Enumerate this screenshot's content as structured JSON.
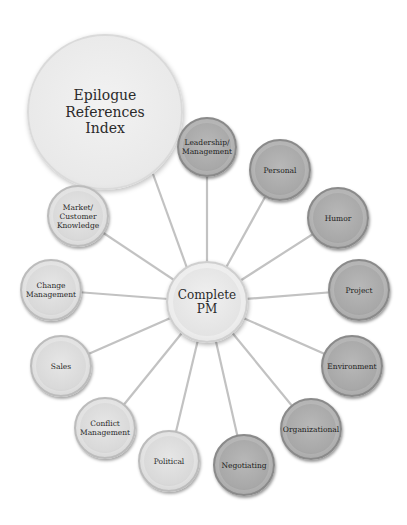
{
  "diagram": {
    "type": "hub-and-spoke",
    "center": {
      "label": "Complete\nPM",
      "x": 207,
      "y": 302,
      "r": 41
    },
    "corner_node": {
      "label": "Epilogue\nReferences\nIndex",
      "x": 105,
      "y": 112,
      "r": 78
    },
    "spokes": [
      {
        "id": "leadership",
        "label": "Leadership/\nManagement",
        "x": 207,
        "y": 147,
        "r": 30,
        "shade": "dark"
      },
      {
        "id": "personal",
        "label": "Personal",
        "x": 280,
        "y": 170,
        "r": 31,
        "shade": "dark"
      },
      {
        "id": "humor",
        "label": "Humor",
        "x": 338,
        "y": 218,
        "r": 31,
        "shade": "dark"
      },
      {
        "id": "project",
        "label": "Project",
        "x": 359,
        "y": 290,
        "r": 31,
        "shade": "dark"
      },
      {
        "id": "environment",
        "label": "Environment",
        "x": 352,
        "y": 366,
        "r": 31,
        "shade": "dark"
      },
      {
        "id": "organizational",
        "label": "Organizational",
        "x": 311,
        "y": 429,
        "r": 31,
        "shade": "dark"
      },
      {
        "id": "negotiating",
        "label": "Negotiating",
        "x": 244,
        "y": 465,
        "r": 31,
        "shade": "dark"
      },
      {
        "id": "political",
        "label": "Political",
        "x": 169,
        "y": 461,
        "r": 31,
        "shade": "light"
      },
      {
        "id": "conflict",
        "label": "Conflict\nManagement",
        "x": 105,
        "y": 428,
        "r": 31,
        "shade": "light"
      },
      {
        "id": "sales",
        "label": "Sales",
        "x": 61,
        "y": 366,
        "r": 31,
        "shade": "light"
      },
      {
        "id": "change",
        "label": "Change\nManagement",
        "x": 51,
        "y": 290,
        "r": 31,
        "shade": "light"
      },
      {
        "id": "market",
        "label": "Market/\nCustomer\nKnowledge",
        "x": 78,
        "y": 216,
        "r": 31,
        "shade": "light"
      }
    ],
    "colors": {
      "line": "#c2c2c2",
      "background": "#ffffff"
    }
  }
}
